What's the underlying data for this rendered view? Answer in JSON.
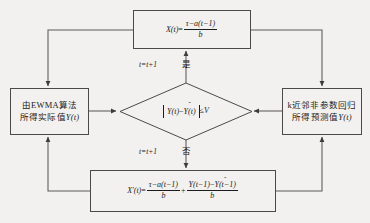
{
  "diagram": {
    "kind": "flowchart",
    "colors": {
      "background": "#f2f1ef",
      "line": "#4a4a4a",
      "text": "#1c1c1c"
    }
  },
  "nodes": {
    "top_box": {
      "name": "X(t) update formula",
      "lhs": "X(t)",
      "equals": "=",
      "numerator": "τ−a(t−1)",
      "denominator": "b",
      "plain": "X(t) = (τ − a(t−1)) / b"
    },
    "left_box": {
      "name": "EWMA actual value",
      "line1": "由EWMA算法",
      "line2_prefix": "所得实际值",
      "line2_symbol": "Y(t)",
      "plain": "由EWMA算法所得实际值Y(t)"
    },
    "right_box": {
      "name": "k-NN non-parametric regression predicted value",
      "line1": "k近邻非参数回归",
      "line2_prefix": "所得预测值",
      "line2_symbol": "Y(t)",
      "line2_symbol_hat": "ˆ",
      "plain": "k近邻非参数回归所得预测值Ŷ(t)"
    },
    "decision": {
      "name": "error threshold test",
      "abs_left": "Y(t)",
      "abs_minus": "−",
      "abs_right": "Y(t)",
      "abs_right_hat": "ˆ",
      "operator": "≤",
      "threshold": "V",
      "plain": "|Y(t) − Ŷ(t)| ≤ V"
    },
    "bottom_box": {
      "name": "X'(t) corrected update formula",
      "lhs": "X'(t)",
      "equals": "=",
      "term1_numerator": "τ−a(t−1)",
      "term1_denominator": "b",
      "plus": "+",
      "term2_numerator_left": "Y(t−1)",
      "term2_numerator_minus": "−",
      "term2_numerator_right": "Y(t−1)",
      "term2_numerator_right_hat": "ˆ",
      "term2_denominator": "b",
      "plain": "X'(t) = (τ−a(t−1))/b + (Y(t−1)−Ŷ(t−1))/b"
    }
  },
  "edges": {
    "yes_branch_counter": "t=t+1",
    "yes_branch_label": "是",
    "no_branch_counter": "t=t+1",
    "no_branch_label": "否"
  }
}
